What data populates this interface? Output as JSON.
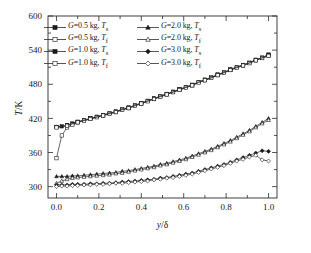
{
  "chart_data": {
    "type": "line",
    "title": "",
    "xlabel": "y/δ",
    "ylabel": "T/K",
    "xlim": [
      -0.04,
      1.04
    ],
    "ylim": [
      280,
      600
    ],
    "xticks": [
      "0.0",
      "0.2",
      "0.4",
      "0.6",
      "0.8",
      "1.0"
    ],
    "xtick_values": [
      0.0,
      0.2,
      0.4,
      0.6,
      0.8,
      1.0
    ],
    "yticks": [
      "300",
      "360",
      "420",
      "480",
      "540",
      "600"
    ],
    "ytick_values": [
      300,
      360,
      420,
      480,
      540,
      600
    ],
    "grid": false,
    "legend_position": "upper-left",
    "x": [
      0.0,
      0.025,
      0.05,
      0.075,
      0.1,
      0.13,
      0.16,
      0.19,
      0.22,
      0.25,
      0.28,
      0.31,
      0.34,
      0.37,
      0.4,
      0.43,
      0.46,
      0.49,
      0.52,
      0.55,
      0.58,
      0.61,
      0.64,
      0.67,
      0.7,
      0.73,
      0.76,
      0.79,
      0.82,
      0.85,
      0.88,
      0.91,
      0.94,
      0.97,
      1.0
    ],
    "series": [
      {
        "name": "G=0.5 kg, Ts",
        "g": "0.5",
        "temp": "s",
        "marker": "square",
        "filled": true,
        "values": [
          405,
          406,
          408,
          411,
          414,
          417,
          420,
          423,
          426,
          429,
          432,
          436,
          439,
          443,
          447,
          451,
          455,
          459,
          463,
          467,
          471,
          475,
          479,
          484,
          488,
          492,
          497,
          501,
          506,
          510,
          514,
          518,
          523,
          527,
          532
        ]
      },
      {
        "name": "G=0.5 kg, Tf",
        "g": "0.5",
        "temp": "f",
        "marker": "square",
        "filled": false,
        "values": [
          350,
          390,
          404,
          409,
          413,
          416,
          419,
          422,
          425,
          428,
          431,
          435,
          438,
          442,
          446,
          450,
          454,
          458,
          462,
          466,
          470,
          474,
          478,
          483,
          487,
          491,
          496,
          500,
          505,
          509,
          513,
          517,
          522,
          526,
          530
        ]
      },
      {
        "name": "G=1.0 kg, Ts",
        "g": "1.0",
        "temp": "s",
        "marker": "square",
        "filled": true,
        "values": [
          405,
          406,
          408,
          411,
          414,
          417,
          420,
          423,
          426,
          429,
          432,
          436,
          439,
          443,
          447,
          451,
          455,
          459,
          463,
          467,
          471,
          475,
          479,
          484,
          488,
          492,
          497,
          501,
          506,
          510,
          514,
          518,
          523,
          527,
          532
        ]
      },
      {
        "name": "G=1.0 kg, Tf",
        "g": "1.0",
        "temp": "f",
        "marker": "square",
        "filled": false,
        "values": [
          404,
          405,
          407,
          410,
          413,
          416,
          419,
          422,
          425,
          428,
          431,
          435,
          438,
          442,
          446,
          450,
          454,
          458,
          462,
          466,
          470,
          474,
          478,
          483,
          487,
          491,
          496,
          500,
          505,
          509,
          513,
          517,
          522,
          526,
          530
        ]
      },
      {
        "name": "G=2.0 kg, Ts",
        "g": "2.0",
        "temp": "s",
        "marker": "triangle",
        "filled": true,
        "values": [
          318,
          318,
          318,
          319,
          319,
          320,
          321,
          322,
          323,
          324,
          325,
          327,
          328,
          330,
          332,
          334,
          336,
          339,
          341,
          344,
          347,
          350,
          354,
          358,
          362,
          366,
          371,
          376,
          381,
          387,
          393,
          399,
          406,
          413,
          420
        ]
      },
      {
        "name": "G=2.0 kg, Tf",
        "g": "2.0",
        "temp": "f",
        "marker": "triangle",
        "filled": false,
        "values": [
          306,
          310,
          313,
          315,
          316,
          317,
          318,
          319,
          320,
          321,
          323,
          324,
          326,
          328,
          330,
          332,
          334,
          337,
          339,
          342,
          345,
          348,
          352,
          356,
          360,
          364,
          369,
          374,
          379,
          385,
          391,
          397,
          404,
          411,
          417
        ]
      },
      {
        "name": "G=3.0 kg, Ts",
        "g": "3.0",
        "temp": "s",
        "marker": "diamond",
        "filled": true,
        "values": [
          303,
          303,
          303,
          304,
          304,
          304,
          305,
          305,
          306,
          306,
          307,
          308,
          309,
          310,
          311,
          312,
          313,
          315,
          316,
          318,
          320,
          322,
          324,
          327,
          330,
          333,
          336,
          339,
          343,
          347,
          351,
          355,
          359,
          363,
          362
        ]
      },
      {
        "name": "G=3.0 kg, Tf",
        "g": "3.0",
        "temp": "f",
        "marker": "diamond",
        "filled": false,
        "values": [
          300,
          301,
          301,
          302,
          302,
          303,
          303,
          304,
          304,
          305,
          306,
          306,
          307,
          308,
          309,
          310,
          312,
          313,
          315,
          316,
          318,
          320,
          322,
          325,
          328,
          331,
          334,
          337,
          341,
          345,
          348,
          352,
          355,
          347,
          345
        ]
      }
    ]
  },
  "axes": {
    "y_title_var": "T",
    "y_title_unit": "/K",
    "x_title_var": "y",
    "x_title_unit": "/δ"
  },
  "legend": {
    "entries": [
      {
        "var": "G",
        "eq": "=0.5 kg,",
        "tvar": "T",
        "tsub": "s",
        "marker": "square",
        "filled": true
      },
      {
        "var": "G",
        "eq": "=2.0 kg,",
        "tvar": "T",
        "tsub": "s",
        "marker": "triangle",
        "filled": true
      },
      {
        "var": "G",
        "eq": "=0.5 kg,",
        "tvar": "T",
        "tsub": "f",
        "marker": "square",
        "filled": false
      },
      {
        "var": "G",
        "eq": "=2.0 kg,",
        "tvar": "T",
        "tsub": "f",
        "marker": "triangle",
        "filled": false
      },
      {
        "var": "G",
        "eq": "=1.0 kg,",
        "tvar": "T",
        "tsub": "s",
        "marker": "square",
        "filled": true
      },
      {
        "var": "G",
        "eq": "=3.0 kg,",
        "tvar": "T",
        "tsub": "s",
        "marker": "diamond",
        "filled": true
      },
      {
        "var": "G",
        "eq": "=1.0 kg,",
        "tvar": "T",
        "tsub": "f",
        "marker": "square",
        "filled": false
      },
      {
        "var": "G",
        "eq": "=3.0 kg,",
        "tvar": "T",
        "tsub": "f",
        "marker": "diamond",
        "filled": false
      }
    ]
  },
  "colors": {
    "axis": "#2b2b2b",
    "curve": "#2b2b2b",
    "marker_fill": "#1b1b1b",
    "marker_open": "#ffffff",
    "background": "#ffffff"
  }
}
